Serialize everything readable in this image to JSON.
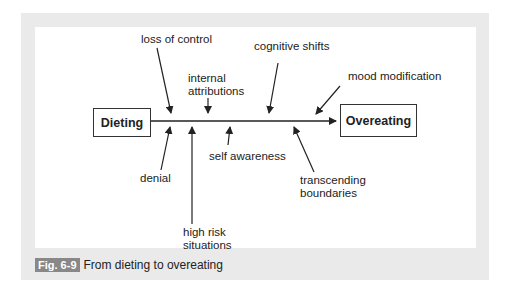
{
  "diagram": {
    "start_box": "Dieting",
    "end_box": "Overeating",
    "factors_above": [
      {
        "label": "loss of control"
      },
      {
        "label": "internal attributions"
      },
      {
        "label": "cognitive shifts"
      },
      {
        "label": "mood modification"
      }
    ],
    "factors_below": [
      {
        "label": "denial"
      },
      {
        "label": "high risk situations"
      },
      {
        "label": "self awareness"
      },
      {
        "label": "transcending boundaries"
      }
    ]
  },
  "caption": {
    "fig_number": "Fig. 6-9",
    "text": "From dieting to overeating"
  },
  "colors": {
    "frame": "#eaeaea",
    "fig_badge": "#888888",
    "line": "#222222"
  }
}
